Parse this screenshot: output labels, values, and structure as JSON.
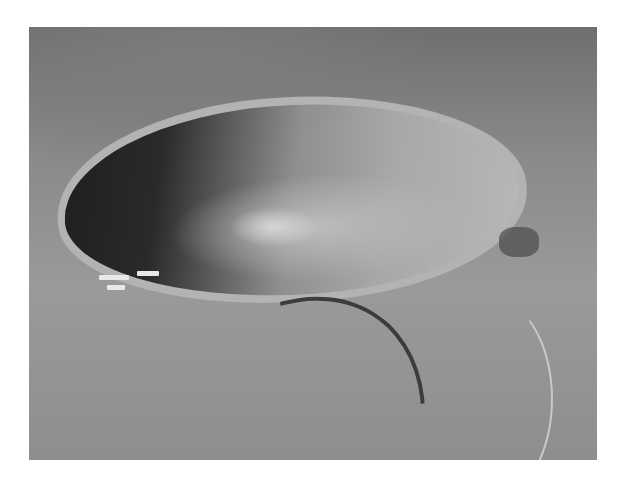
{
  "image": {
    "description": "Aerial grayscale photograph of a large meteor impact crater in a desert landscape, with a visitor building complex and winding road at the lower left",
    "subject": "impact crater",
    "color_mode": "grayscale",
    "colors": {
      "background": "#ffffff",
      "terrain": "#8e8e8e",
      "crater_shadow": "#1e1e1e",
      "crater_lit_wall": "#b8b8b8",
      "road": "#3c3c3c"
    }
  }
}
